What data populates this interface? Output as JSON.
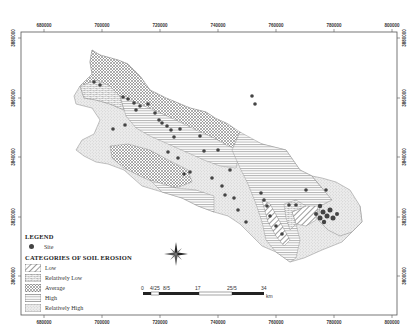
{
  "map": {
    "frame": {
      "x": 21,
      "y": 32,
      "width": 376,
      "height": 283
    },
    "x_ticks": [
      {
        "label": "680000",
        "x": 44
      },
      {
        "label": "700000",
        "x": 102
      },
      {
        "label": "720000",
        "x": 160
      },
      {
        "label": "740000",
        "x": 218
      },
      {
        "label": "760000",
        "x": 276
      },
      {
        "label": "780000",
        "x": 334
      },
      {
        "label": "800000",
        "x": 392
      }
    ],
    "y_ticks": [
      {
        "label": "3880000",
        "y": 38
      },
      {
        "label": "3860000",
        "y": 98
      },
      {
        "label": "3840000",
        "y": 157
      },
      {
        "label": "3820000",
        "y": 217
      },
      {
        "label": "3800000",
        "y": 276
      }
    ]
  },
  "legend": {
    "title": "LEGEND",
    "site_label": "Site",
    "categories_title": "CATEGORIES OF SOIL EROSION",
    "categories": [
      {
        "label": "Low",
        "pattern": "diagonal-hatch"
      },
      {
        "label": "Relatively Low",
        "pattern": "brick-dashed"
      },
      {
        "label": "Average",
        "pattern": "crosshatch"
      },
      {
        "label": "High",
        "pattern": "horizontal-lines"
      },
      {
        "label": "Relatively High",
        "pattern": "stipple"
      }
    ]
  },
  "scale_bar": {
    "labels": [
      "0",
      "4/25",
      "8/5",
      "17",
      "25/5",
      "34"
    ],
    "unit": "km"
  },
  "north_arrow": {
    "icon": "compass-rose-icon"
  },
  "colors": {
    "frame": "#555555",
    "site": "#444444",
    "pattern": "#777777"
  }
}
